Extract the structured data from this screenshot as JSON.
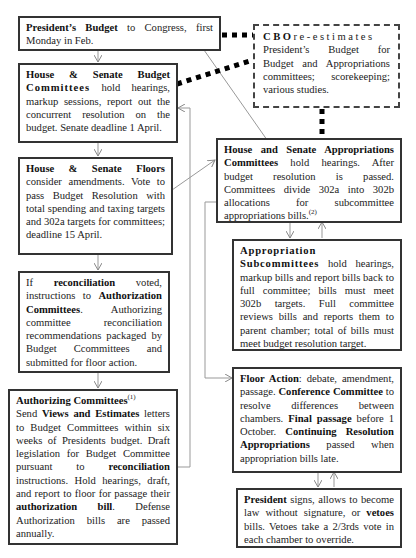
{
  "diagram": {
    "nodes": {
      "presidents_budget": {
        "bold": "President’s Budget",
        "text": " to Congress,  first Monday in Feb."
      },
      "budget_committees": {
        "bold1": "House & Senate Budget",
        "bold2": "Committees",
        "text": " hold hearings, markup sessions, report out the concurrent resolution on the budget. Senate deadline 1 April."
      },
      "cbo": {
        "bold": "CBO",
        "spaced": "re-estimates",
        "text": "President’s Budget for Budget and Appropriations committees; scorekeeping; various studies."
      },
      "floors": {
        "bold": "House & Senate Floors",
        "text": " consider amendments. Vote to pass Budget Resolution with total spending and taxing targets and 302a targets for committees; deadline 15 April."
      },
      "appropriations_committees": {
        "bold1": "House and Senate Appropriations",
        "bold2": "Committees",
        "text": " hold hearings. After budget resolution is passed. Committees divide 302a into 302b allocations for subcommittee appropriations bills.",
        "footnote": "(2)"
      },
      "reconciliation": {
        "t1": "If ",
        "b1": "reconciliation",
        "t2": " voted, instructions to ",
        "b2": "Authorization Committees",
        "t3": ". Authorizing committee reconciliation recommendations packaged by Budget Ccommittees and submitted for floor action."
      },
      "subcommittees": {
        "bold": "Appropriation Subcommittees",
        "text": " hold hearings, markup bills and report bills back to full committee; bills must meet 302b targets. Full committee reviews bills and reports them to parent chamber; total of bills must meet budget resolution target."
      },
      "authorizing_committees": {
        "bold": "Authorizing Committees",
        "footnote": "(1)",
        "t1": "Send ",
        "b1": "Views and Estimates",
        "t2": " letters to Budget Committees within six weeks of Presidents budget. Draft legislation for Budget Committee pursuant to ",
        "b2": "reconciliation",
        "t3": " instructions. Hold hearings, draft, and report to floor for passage their ",
        "b3": "authorization bill",
        "t4": ". Defense Authorization bills are passed annually."
      },
      "floor_action": {
        "b1": "Floor Action",
        "t1": ": debate, amendment, passage. ",
        "b2": "Conference Committee",
        "t2": " to resolve differences between chambers. ",
        "b3": "Final passage",
        "t3": " before 1 October. ",
        "b4": "Continuing Resolution Appropriations",
        "t4": " passed when appropriation bills late."
      },
      "president_signs": {
        "b1": "President",
        "t1": " signs, allows to become law without signature,  or ",
        "b2": "vetoes",
        "t2": " bills. Vetoes take a  2/3rds vote in each chamber to override."
      }
    },
    "colors": {
      "border": "#333333",
      "connector": "#999999",
      "dotted_link": "#000000"
    }
  }
}
